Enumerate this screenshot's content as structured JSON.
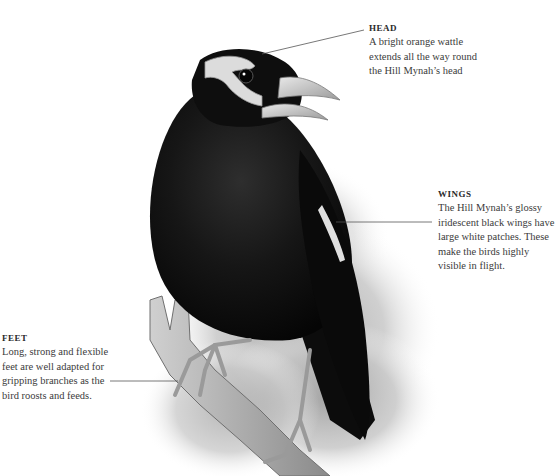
{
  "figure": {
    "callouts": [
      {
        "id": "head",
        "title": "HEAD",
        "body": "A bright orange wattle\nextends all the way round\nthe Hill Mynah’s head"
      },
      {
        "id": "wings",
        "title": "WINGS",
        "body": "The Hill Mynah’s glossy\niridescent black wings have\nlarge white patches. These\nmake the birds highly\nvisible in flight."
      },
      {
        "id": "feet",
        "title": "FEET",
        "body": "Long, strong and flexible\nfeet are well adapted for\ngripping branches as the\nbird roosts and feeds."
      }
    ],
    "colors": {
      "background": "#ffffff",
      "plumage": "#111111",
      "beak": "#cfcfcf",
      "foliage": "#bdbdbd",
      "text": "#3b3b3b",
      "leader_line": "#555555"
    }
  }
}
